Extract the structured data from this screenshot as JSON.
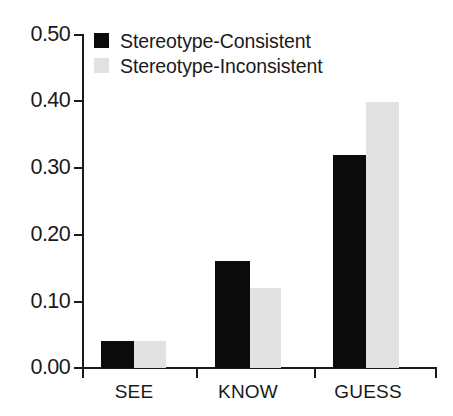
{
  "chart_data": {
    "type": "bar",
    "title": "",
    "subtitle": "",
    "xlabel": "",
    "ylabel": "",
    "categories": [
      "SEE",
      "KNOW",
      "GUESS"
    ],
    "series": [
      {
        "name": "Stereotype-Consistent",
        "color": "#0b0b0b",
        "values": [
          0.04,
          0.16,
          0.32
        ]
      },
      {
        "name": "Stereotype-Inconsistent",
        "color": "#e2e2e2",
        "values": [
          0.04,
          0.12,
          0.4
        ]
      }
    ],
    "ylim": [
      0.0,
      0.5
    ],
    "ytick_values": [
      0.0,
      0.1,
      0.2,
      0.3,
      0.4,
      0.5
    ],
    "ytick_labels": [
      "0.00",
      "0.10",
      "0.20",
      "0.30",
      "0.40",
      "0.50"
    ],
    "grid": false,
    "legend_position": "top-left",
    "bar_gap": "grouped-adjacent"
  },
  "legend": {
    "entries": [
      {
        "label": "Stereotype-Consistent",
        "swatch": "black-square-swatch"
      },
      {
        "label": "Stereotype-Inconsistent",
        "swatch": "gray-square-swatch"
      }
    ]
  },
  "axes": {
    "y_labels": [
      "0.50",
      "0.40",
      "0.30",
      "0.20",
      "0.10",
      "0.00"
    ],
    "x_labels": [
      "SEE",
      "KNOW",
      "GUESS"
    ]
  },
  "colors": {
    "consistent": "#0b0b0b",
    "inconsistent": "#e2e2e2",
    "axis": "#1a1a1a",
    "background": "#ffffff"
  }
}
